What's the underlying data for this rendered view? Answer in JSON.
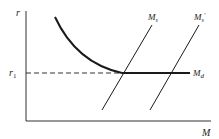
{
  "diagram": {
    "type": "economics money market diagram",
    "axes": {
      "y_label": "r",
      "x_label": "M"
    },
    "reference": {
      "label": "r",
      "subscript": "1",
      "style": "dashed"
    },
    "curves": [
      {
        "id": "md",
        "label": "M",
        "subscript": "d",
        "description": "money demand curve: downward-sloping then horizontal at r1 (liquidity trap)"
      },
      {
        "id": "ms",
        "label": "M",
        "subscript": "s",
        "description": "money supply (upward-sloping line)"
      },
      {
        "id": "ms-prime",
        "label": "M",
        "subscript": "s",
        "prime": "′",
        "description": "shifted money supply (upward-sloping line, to the right)"
      }
    ],
    "colors": {
      "ink": "#222222",
      "background": "#ffffff"
    }
  }
}
